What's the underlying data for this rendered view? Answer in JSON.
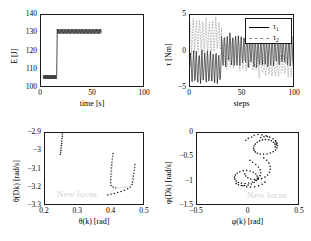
{
  "figure": {
    "background": "#ffffff",
    "axis_color": "#1a1a1a",
    "series_primary_color": "#000000",
    "series_secondary_color": "#8a8a8a",
    "watermark_color": "#d2d2d2",
    "watermark_text": "New locus"
  },
  "chart_data": [
    {
      "id": "energy-vs-time",
      "type": "line",
      "title": "",
      "xlabel": "time [s]",
      "ylabel": "E [J]",
      "xlim": [
        0,
        100
      ],
      "ylim": [
        100,
        140
      ],
      "xticks": [
        0,
        50,
        100
      ],
      "xtick_labels": [
        "0",
        "50",
        "100"
      ],
      "yticks": [
        100,
        110,
        120,
        130,
        140
      ],
      "ytick_labels": [
        "100",
        "110",
        "120",
        "130",
        "140"
      ],
      "grid": false,
      "legend": "none",
      "description": "Step change in mechanical energy: low-energy oscillatory limit cycle near 106 J until about t = 15 s, then jump to a higher-energy limit cycle oscillating near 131 J, data ending near t = 58 s.",
      "series": [
        {
          "name": "E",
          "style": "solid",
          "color": "#000000",
          "segments": [
            {
              "phase": "low-energy limit cycle",
              "x_range": [
                2.0,
                15.0
              ],
              "mean": 106.0,
              "amplitude": 1.1,
              "oscillation_period_s": 1.1
            },
            {
              "phase": "transition",
              "x_range": [
                15.0,
                15.6
              ],
              "from": 106.2,
              "to": 131.0
            },
            {
              "phase": "high-energy limit cycle",
              "x_range": [
                15.6,
                58.0
              ],
              "mean": 131.0,
              "amplitude": 1.3,
              "oscillation_period_s": 1.35
            }
          ]
        }
      ]
    },
    {
      "id": "torque-vs-steps",
      "type": "line",
      "title": "",
      "xlabel": "steps",
      "ylabel": "τ [Nm]",
      "xlim": [
        0,
        100
      ],
      "ylim": [
        -5,
        5
      ],
      "xticks": [
        0,
        50,
        100
      ],
      "xtick_labels": [
        "0",
        "50",
        "100"
      ],
      "yticks": [
        -5,
        0,
        5
      ],
      "ytick_labels": [
        "−5",
        "0",
        "5"
      ],
      "grid": false,
      "legend": "upper right",
      "description": "Two control torques plotted against step number. Tau1 (solid black) oscillates about -2 Nm for the first ~30 steps then shifts to oscillate about 0 with growing amplitude. Tau2 (dashed grey) starts oscillating about +2 Nm and drifts downward toward -2 Nm.",
      "series": [
        {
          "name": "τ₁",
          "legend_label": "τ",
          "legend_subscript": "1",
          "style": "solid",
          "color": "#000000",
          "segments": [
            {
              "x_range": [
                0,
                30
              ],
              "mean": -2.1,
              "amplitude": 2.0
            },
            {
              "x_range": [
                30,
                60
              ],
              "mean": 0.2,
              "amplitude": 2.1
            },
            {
              "x_range": [
                60,
                100
              ],
              "mean": 0.0,
              "amplitude": 1.9
            }
          ]
        },
        {
          "name": "τ₂",
          "legend_label": "τ",
          "legend_subscript": "2",
          "style": "dashed",
          "color": "#8a8a8a",
          "segments": [
            {
              "x_range": [
                0,
                30
              ],
              "mean": 2.2,
              "amplitude": 2.2
            },
            {
              "x_range": [
                30,
                65
              ],
              "mean": -0.6,
              "amplitude": 1.7
            },
            {
              "x_range": [
                65,
                100
              ],
              "mean": -1.9,
              "amplitude": 1.3
            }
          ]
        }
      ]
    },
    {
      "id": "theta-phase-portrait",
      "type": "scatter",
      "title": "",
      "xlabel": "θ(k) [rad]",
      "ylabel": "θ(Dk) [rad/s]",
      "xlim": [
        0.2,
        0.5
      ],
      "ylim": [
        -3.3,
        -2.9
      ],
      "xticks": [
        0.2,
        0.3,
        0.4,
        0.5
      ],
      "xtick_labels": [
        "0.2",
        "0.3",
        "0.4",
        "0.5"
      ],
      "yticks": [
        -3.3,
        -3.2,
        -3.1,
        -3.0,
        -2.9
      ],
      "ytick_labels": [
        "−3.3",
        "−3.2",
        "−3.1",
        "−3",
        "−2.9"
      ],
      "grid": false,
      "legend": "none",
      "annotation": "New locus",
      "description": "Poincare section of the stance-leg angle versus angular velocity. A tight dotted cluster sits near theta = 0.25 rad at the top left; two further dotted branches run steeply near theta = 0.40 and 0.46 rad, joined by faint light-grey connecting strands near the bottom.",
      "points": [
        [
          0.252,
          -2.905
        ],
        [
          0.252,
          -2.918
        ],
        [
          0.251,
          -2.93
        ],
        [
          0.25,
          -2.944
        ],
        [
          0.25,
          -2.957
        ],
        [
          0.249,
          -2.969
        ],
        [
          0.248,
          -2.982
        ],
        [
          0.248,
          -2.994
        ],
        [
          0.247,
          -3.006
        ],
        [
          0.246,
          -3.016
        ],
        [
          0.404,
          -3.012
        ],
        [
          0.403,
          -3.028
        ],
        [
          0.402,
          -3.044
        ],
        [
          0.401,
          -3.06
        ],
        [
          0.4,
          -3.076
        ],
        [
          0.399,
          -3.092
        ],
        [
          0.399,
          -3.108
        ],
        [
          0.398,
          -3.124
        ],
        [
          0.398,
          -3.14
        ],
        [
          0.397,
          -3.156
        ],
        [
          0.397,
          -3.172
        ],
        [
          0.398,
          -3.188
        ],
        [
          0.404,
          -3.196
        ],
        [
          0.412,
          -3.2
        ],
        [
          0.47,
          -3.072
        ],
        [
          0.469,
          -3.088
        ],
        [
          0.468,
          -3.104
        ],
        [
          0.466,
          -3.12
        ],
        [
          0.465,
          -3.136
        ],
        [
          0.464,
          -3.152
        ],
        [
          0.463,
          -3.168
        ],
        [
          0.461,
          -3.182
        ],
        [
          0.456,
          -3.196
        ],
        [
          0.448,
          -3.206
        ],
        [
          0.438,
          -3.214
        ],
        [
          0.428,
          -3.22
        ],
        [
          0.418,
          -3.226
        ],
        [
          0.408,
          -3.232
        ],
        [
          0.398,
          -3.236
        ],
        [
          0.388,
          -3.24
        ]
      ]
    },
    {
      "id": "phi-phase-portrait",
      "type": "scatter",
      "title": "",
      "xlabel": "φ(k) [rad]",
      "ylabel": "φ(Dk) [rad/s]",
      "xlim": [
        -0.5,
        0.5
      ],
      "ylim": [
        -1.5,
        0.0
      ],
      "xticks": [
        -0.5,
        0,
        0.5
      ],
      "xtick_labels": [
        "−0.5",
        "0",
        "0.5"
      ],
      "yticks": [
        -1.5,
        -1.0,
        -0.5,
        0.0
      ],
      "ytick_labels": [
        "−1.5",
        "−1",
        "−0.5",
        "0"
      ],
      "grid": false,
      "legend": "none",
      "annotation": "New locus",
      "description": "Poincare section of the swing-leg angle versus angular velocity. Scattered dots form an upper loop centred near phi = 0.15 rad, phi-dot = -0.35 rad/s, and a lower, more diffuse cloud centred near phi = 0.0 rad, phi-dot = -1.05 rad/s.",
      "points": [
        [
          0.055,
          -0.045
        ],
        [
          0.092,
          -0.032
        ],
        [
          0.131,
          -0.04
        ],
        [
          0.17,
          -0.058
        ],
        [
          0.205,
          -0.085
        ],
        [
          0.238,
          -0.12
        ],
        [
          0.262,
          -0.163
        ],
        [
          0.276,
          -0.21
        ],
        [
          0.281,
          -0.258
        ],
        [
          0.276,
          -0.305
        ],
        [
          0.262,
          -0.348
        ],
        [
          0.24,
          -0.385
        ],
        [
          0.212,
          -0.412
        ],
        [
          0.18,
          -0.43
        ],
        [
          0.146,
          -0.438
        ],
        [
          0.114,
          -0.432
        ],
        [
          0.086,
          -0.415
        ],
        [
          0.066,
          -0.388
        ],
        [
          0.054,
          -0.352
        ],
        [
          0.05,
          -0.312
        ],
        [
          0.054,
          -0.268
        ],
        [
          0.066,
          -0.228
        ],
        [
          0.084,
          -0.192
        ],
        [
          0.108,
          -0.162
        ],
        [
          0.136,
          -0.142
        ],
        [
          0.166,
          -0.134
        ],
        [
          0.196,
          -0.14
        ],
        [
          0.222,
          -0.16
        ],
        [
          0.243,
          -0.19
        ],
        [
          0.256,
          -0.228
        ],
        [
          0.014,
          -0.56
        ],
        [
          0.04,
          -0.6
        ],
        [
          0.07,
          -0.646
        ],
        [
          0.096,
          -0.7
        ],
        [
          0.112,
          -0.758
        ],
        [
          0.118,
          -0.818
        ],
        [
          0.112,
          -0.876
        ],
        [
          0.096,
          -0.928
        ],
        [
          0.07,
          -0.972
        ],
        [
          0.038,
          -1.006
        ],
        [
          0.002,
          -1.028
        ],
        [
          -0.034,
          -1.038
        ],
        [
          -0.068,
          -1.034
        ],
        [
          -0.098,
          -1.016
        ],
        [
          -0.12,
          -0.986
        ],
        [
          -0.133,
          -0.948
        ],
        [
          -0.136,
          -0.906
        ],
        [
          -0.128,
          -0.864
        ],
        [
          -0.11,
          -0.826
        ],
        [
          -0.084,
          -0.796
        ],
        [
          -0.052,
          -0.778
        ],
        [
          -0.018,
          -0.772
        ],
        [
          0.016,
          -0.782
        ],
        [
          0.046,
          -0.806
        ],
        [
          0.07,
          -0.842
        ],
        [
          0.084,
          -0.886
        ],
        [
          0.086,
          -0.932
        ],
        [
          0.076,
          -0.976
        ],
        [
          0.056,
          -1.016
        ],
        [
          0.028,
          -1.048
        ],
        [
          -0.004,
          -1.07
        ],
        [
          -0.038,
          -1.08
        ],
        [
          -0.07,
          -1.078
        ],
        [
          -0.098,
          -1.064
        ],
        [
          -0.12,
          -1.04
        ],
        [
          0.148,
          -0.512
        ],
        [
          0.176,
          -0.56
        ],
        [
          0.198,
          -0.618
        ],
        [
          0.21,
          -0.682
        ],
        [
          0.212,
          -0.746
        ],
        [
          0.204,
          -0.808
        ],
        [
          0.186,
          -0.862
        ],
        [
          0.16,
          -0.906
        ],
        [
          0.128,
          -0.938
        ],
        [
          0.092,
          -0.956
        ],
        [
          0.056,
          -0.958
        ],
        [
          0.022,
          -0.946
        ],
        [
          -0.006,
          -0.92
        ],
        [
          -0.026,
          -0.884
        ],
        [
          -0.036,
          -0.842
        ],
        [
          0.258,
          -0.286
        ],
        [
          0.268,
          -0.244
        ],
        [
          0.27,
          -0.2
        ],
        [
          0.264,
          -0.158
        ],
        [
          0.12,
          -0.092
        ],
        [
          0.15,
          -0.076
        ],
        [
          0.182,
          -0.078
        ],
        [
          0.03,
          -0.082
        ],
        [
          -0.002,
          -0.11
        ],
        [
          -0.026,
          -0.148
        ],
        [
          0.16,
          -1.01
        ],
        [
          0.132,
          -1.054
        ],
        [
          0.098,
          -1.086
        ],
        [
          0.06,
          -1.106
        ],
        [
          0.02,
          -1.112
        ],
        [
          -0.018,
          -1.104
        ],
        [
          -0.054,
          -1.084
        ]
      ]
    }
  ]
}
